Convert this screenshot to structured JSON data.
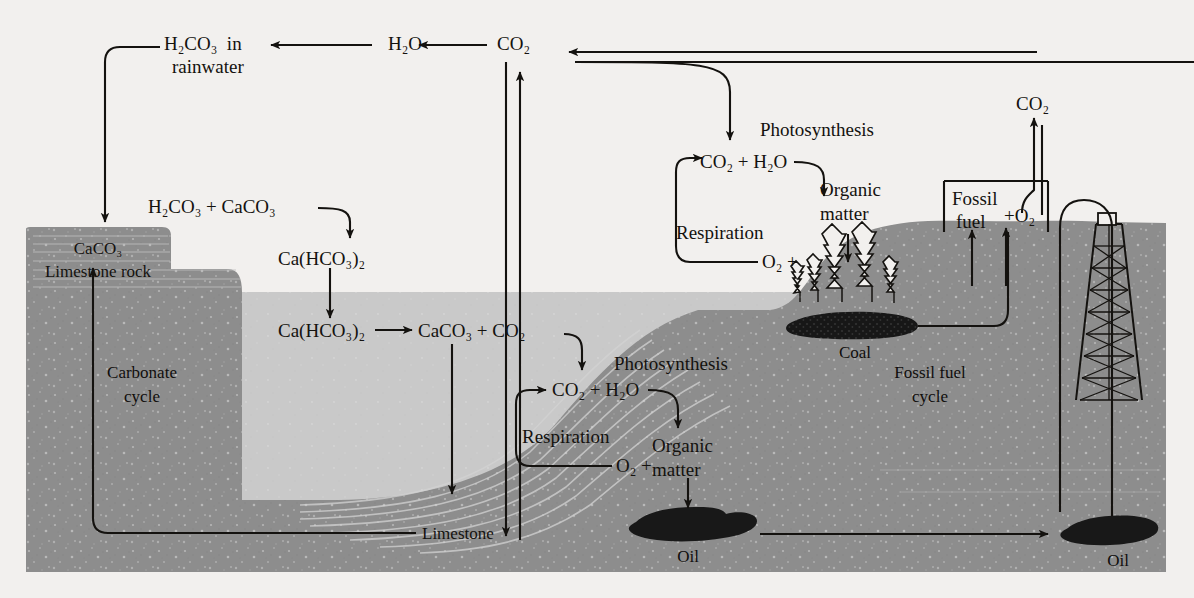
{
  "diagram": {
    "type": "carbon-cycle-cross-section",
    "cycles": [
      {
        "id": "carbonate",
        "label_line1": "Carbonate",
        "label_line2": "cycle"
      },
      {
        "id": "fossil-fuel",
        "label_line1": "Fossil fuel",
        "label_line2": "cycle"
      }
    ],
    "atmosphere": {
      "carbonic_acid_line1": "H",
      "carbonic_acid": "H₂CO₃  in",
      "carbonic_acid_line2": "rainwater",
      "water": "H₂O",
      "carbon_dioxide": "CO₂"
    },
    "weathering": {
      "reactants": "H₂CO₃ + CaCO₃",
      "product_upper": "Ca(HCO₃)₂",
      "product_lower": "Ca(HCO₃)₂",
      "precipitation": "CaCO₃ + CO₂"
    },
    "rock": {
      "formula": "CaCO₃",
      "name": "Limestone rock",
      "seafloor_label": "Limestone"
    },
    "ocean_biology": {
      "photosynthesis": "Photosynthesis",
      "respiration": "Respiration",
      "inputs": "CO₂ + H₂O",
      "oxygen": "O₂ +",
      "organic_line1": "Organic",
      "organic_line2": "matter"
    },
    "land_biology": {
      "photosynthesis": "Photosynthesis",
      "respiration": "Respiration",
      "inputs": "CO₂ + H₂O",
      "oxygen": "O₂ +",
      "organic_line1": "Organic",
      "organic_line2": "matter"
    },
    "fossil_fuels": {
      "deposit_coal": "Coal",
      "deposit_oil_ocean": "Oil",
      "deposit_oil_land": "Oil",
      "combustion_line1": "Fossil",
      "combustion_line2": "fuel",
      "oxidant": "+O₂",
      "emission": "CO₂"
    },
    "colors": {
      "paper": "#f2f0ee",
      "rock": "#8d8d8d",
      "water": "#c9c9c9",
      "deposit": "#1a1a1a",
      "ink": "#14120f"
    }
  }
}
